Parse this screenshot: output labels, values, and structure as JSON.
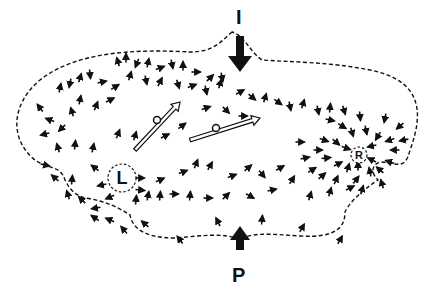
{
  "diagram": {
    "labels": {
      "top_marker": "I",
      "bottom_marker": "P",
      "left_center": "L",
      "right_center": "R"
    },
    "colors": {
      "ink": "#111111",
      "background": "#ffffff"
    },
    "outline": "M 232 32 C 222 40 215 52 190 52 C 150 50 80 48 40 80 C 10 105 10 140 35 160 C 50 170 60 165 65 180 C 70 190 75 195 85 198 C 100 200 115 205 130 215 C 132 225 140 238 175 238 C 200 236 225 232 240 240 C 250 232 270 234 300 236 C 335 238 345 228 345 212 C 350 200 370 185 378 180 C 370 172 372 165 380 162 C 395 162 405 172 410 150 C 425 110 420 80 370 70 C 330 62 290 62 262 60 C 250 52 245 36 232 32 Z",
    "big_arrows": [
      {
        "name": "top-inflow-arrow",
        "x": 240,
        "y1": 8,
        "y2": 72,
        "dir": "down"
      },
      {
        "name": "bottom-inflow-arrow",
        "x": 240,
        "y1": 250,
        "y2": 228,
        "dir": "up"
      }
    ],
    "centers": [
      {
        "name": "left-vortex-L",
        "cx": 122,
        "cy": 178,
        "r": 14,
        "label_key": "left_center"
      },
      {
        "name": "right-vortex-R",
        "cx": 359,
        "cy": 155,
        "r": 8,
        "label_key": "right_center"
      }
    ],
    "hollow_arrows": [
      {
        "x1": 135,
        "y1": 150,
        "x2": 180,
        "y2": 102
      },
      {
        "x1": 190,
        "y1": 140,
        "x2": 260,
        "y2": 118
      }
    ],
    "small_circles": [
      {
        "cx": 157,
        "cy": 120,
        "r": 3.5
      },
      {
        "cx": 216,
        "cy": 128,
        "r": 3.5
      }
    ],
    "field_arrows": [
      [
        118,
        62,
        -0.3,
        -1
      ],
      [
        126,
        58,
        0,
        -1
      ],
      [
        137,
        63,
        -0.4,
        1
      ],
      [
        148,
        63,
        0.2,
        -1
      ],
      [
        160,
        68,
        0.8,
        -0.3
      ],
      [
        172,
        64,
        0.2,
        1
      ],
      [
        183,
        66,
        0,
        -1
      ],
      [
        196,
        72,
        0.9,
        0
      ],
      [
        210,
        78,
        0.6,
        -0.6
      ],
      [
        222,
        77,
        0.2,
        1
      ],
      [
        60,
        88,
        0.2,
        -1
      ],
      [
        70,
        83,
        -0.2,
        1
      ],
      [
        80,
        78,
        0.3,
        -1
      ],
      [
        90,
        74,
        0.1,
        1
      ],
      [
        102,
        82,
        0.9,
        -0.2
      ],
      [
        115,
        87,
        0.8,
        -0.5
      ],
      [
        130,
        76,
        0.3,
        -1
      ],
      [
        146,
        80,
        0.2,
        1
      ],
      [
        160,
        82,
        0.5,
        -1
      ],
      [
        178,
        84,
        0.3,
        1
      ],
      [
        192,
        86,
        0.8,
        -0.3
      ],
      [
        206,
        90,
        0.2,
        1
      ],
      [
        220,
        84,
        0.3,
        -1
      ],
      [
        240,
        92,
        0.9,
        -0.5
      ],
      [
        252,
        97,
        0.7,
        0.6
      ],
      [
        265,
        98,
        0.3,
        -1
      ],
      [
        278,
        102,
        0.7,
        0.5
      ],
      [
        290,
        106,
        0.2,
        1
      ],
      [
        303,
        104,
        0.3,
        -1
      ],
      [
        318,
        110,
        0.2,
        1
      ],
      [
        330,
        108,
        0.1,
        -1
      ],
      [
        40,
        108,
        -0.6,
        -0.8
      ],
      [
        50,
        120,
        -0.8,
        -0.3
      ],
      [
        62,
        128,
        -0.6,
        0.6
      ],
      [
        45,
        134,
        -0.8,
        0.2
      ],
      [
        72,
        112,
        -0.3,
        -1
      ],
      [
        80,
        100,
        0.2,
        -1
      ],
      [
        96,
        106,
        0.4,
        -1
      ],
      [
        110,
        100,
        0.8,
        -0.4
      ],
      [
        58,
        148,
        -0.3,
        -1
      ],
      [
        75,
        145,
        0.1,
        -1
      ],
      [
        93,
        148,
        0.2,
        -1
      ],
      [
        118,
        134,
        0.4,
        -1
      ],
      [
        135,
        136,
        0.3,
        -1
      ],
      [
        165,
        136,
        0.8,
        -0.4
      ],
      [
        182,
        126,
        0.8,
        -0.6
      ],
      [
        206,
        108,
        0.9,
        -0.3
      ],
      [
        226,
        110,
        0.6,
        0.6
      ],
      [
        243,
        116,
        0.9,
        0
      ],
      [
        45,
        165,
        0.9,
        0.2
      ],
      [
        55,
        178,
        -0.7,
        -0.6
      ],
      [
        72,
        180,
        0.1,
        -1
      ],
      [
        95,
        168,
        -0.8,
        -0.6
      ],
      [
        102,
        185,
        -0.9,
        0.2
      ],
      [
        68,
        195,
        -0.3,
        -1
      ],
      [
        82,
        200,
        -0.7,
        -0.7
      ],
      [
        96,
        208,
        -0.6,
        0.1
      ],
      [
        110,
        197,
        -0.7,
        0.3
      ],
      [
        140,
        178,
        1,
        0
      ],
      [
        140,
        190,
        1,
        0.1
      ],
      [
        160,
        180,
        0.7,
        -0.3
      ],
      [
        183,
        172,
        0.8,
        -0.3
      ],
      [
        196,
        164,
        0.4,
        -1
      ],
      [
        210,
        166,
        0.5,
        -0.9
      ],
      [
        232,
        176,
        0.8,
        -0.3
      ],
      [
        248,
        168,
        0.7,
        -0.6
      ],
      [
        262,
        174,
        0.5,
        0.6
      ],
      [
        280,
        168,
        0.7,
        -0.4
      ],
      [
        136,
        200,
        0.1,
        -1
      ],
      [
        148,
        196,
        0.2,
        -1
      ],
      [
        160,
        196,
        0.1,
        -1
      ],
      [
        174,
        194,
        0.9,
        0
      ],
      [
        190,
        196,
        0.1,
        -1
      ],
      [
        208,
        198,
        0.9,
        0
      ],
      [
        226,
        196,
        0.6,
        -0.6
      ],
      [
        250,
        196,
        0.7,
        0.4
      ],
      [
        272,
        190,
        0.9,
        -0.2
      ],
      [
        292,
        180,
        0.5,
        -0.8
      ],
      [
        95,
        218,
        -0.6,
        -0.4
      ],
      [
        110,
        220,
        -0.7,
        -0.3
      ],
      [
        124,
        230,
        -0.6,
        -0.7
      ],
      [
        145,
        224,
        -0.7,
        -0.6
      ],
      [
        180,
        240,
        -0.6,
        -0.8
      ],
      [
        218,
        222,
        -0.4,
        -0.8
      ],
      [
        262,
        220,
        0.1,
        -1
      ],
      [
        302,
        228,
        0.5,
        -0.9
      ],
      [
        340,
        240,
        0.5,
        -0.9
      ],
      [
        310,
        196,
        0.3,
        -1
      ],
      [
        330,
        192,
        0.3,
        -1
      ],
      [
        350,
        188,
        0.8,
        -0.4
      ],
      [
        362,
        190,
        0.3,
        -1
      ],
      [
        330,
        120,
        0.9,
        0.2
      ],
      [
        342,
        126,
        0.8,
        0.5
      ],
      [
        352,
        132,
        0.3,
        1
      ],
      [
        366,
        130,
        0.2,
        1
      ],
      [
        378,
        136,
        -0.5,
        0.8
      ],
      [
        390,
        140,
        -0.9,
        0.3
      ],
      [
        395,
        150,
        -1,
        0
      ],
      [
        390,
        162,
        -0.9,
        -0.3
      ],
      [
        380,
        170,
        -0.7,
        -0.6
      ],
      [
        370,
        172,
        -0.2,
        -1
      ],
      [
        348,
        168,
        0.3,
        -1
      ],
      [
        338,
        164,
        0.8,
        -0.4
      ],
      [
        326,
        158,
        1,
        -0.1
      ],
      [
        318,
        150,
        1,
        0
      ],
      [
        324,
        140,
        0.9,
        0.3
      ],
      [
        336,
        142,
        0.7,
        0.6
      ],
      [
        346,
        148,
        0.9,
        0.3
      ],
      [
        372,
        146,
        -0.9,
        0.2
      ],
      [
        372,
        160,
        -0.8,
        -0.4
      ],
      [
        358,
        166,
        0,
        -1
      ],
      [
        300,
        142,
        0.9,
        0
      ],
      [
        305,
        158,
        0.9,
        -0.2
      ],
      [
        312,
        170,
        0.8,
        -0.5
      ],
      [
        322,
        176,
        0.7,
        -0.6
      ],
      [
        336,
        180,
        0.4,
        -0.9
      ],
      [
        356,
        180,
        0.6,
        -0.8
      ],
      [
        382,
        184,
        -0.3,
        -1
      ],
      [
        400,
        126,
        -0.7,
        0.6
      ],
      [
        404,
        140,
        -1,
        0.2
      ],
      [
        385,
        118,
        -0.2,
        1
      ],
      [
        360,
        116,
        0.1,
        1
      ],
      [
        344,
        110,
        0.3,
        1
      ]
    ]
  }
}
